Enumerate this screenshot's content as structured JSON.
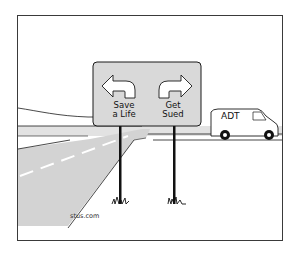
{
  "cartoon": {
    "sign": {
      "left_label_line1": "Save",
      "left_label_line2": "a Life",
      "right_label_line1": "Get",
      "right_label_line2": "Sued",
      "left_arrow_icon": "turn-left-arrow-icon",
      "right_arrow_icon": "turn-right-arrow-icon"
    },
    "van": {
      "label": "ADT"
    },
    "credit": "stus.com"
  },
  "colors": {
    "road": "#d3d3d3",
    "sign_face": "#d9d9d9",
    "outline": "#1a1a1a",
    "background": "#ffffff"
  }
}
